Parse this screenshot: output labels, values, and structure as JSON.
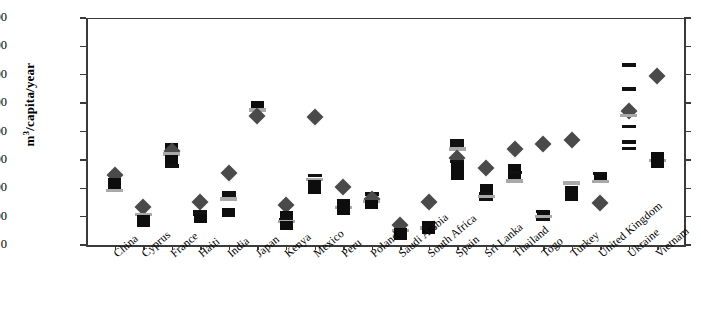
{
  "chart_data": {
    "type": "scatter",
    "title": "",
    "xlabel": "",
    "ylabel": "m3/capita/year",
    "ylabel_display": "m/capita/year",
    "ylabel_sup": "3",
    "ylim": [
      0,
      8000
    ],
    "ytick_values": [
      0,
      1000,
      2000,
      3000,
      4000,
      5000,
      6000,
      7000,
      8000
    ],
    "ytick_labels": [
      "0",
      "1000",
      "2000",
      "3000",
      "4000",
      "5000",
      "6000",
      "7000",
      "8000"
    ],
    "grid": false,
    "legend": "none",
    "categories": [
      "China",
      "Cyprus",
      "France",
      "Haiti",
      "India",
      "Japan",
      "Kenya",
      "Mexico",
      "Peru",
      "Poland",
      "Saudi Arabia",
      "South Africa",
      "Spain",
      "Sri Lanka",
      "Thailand",
      "Togo",
      "Turkey",
      "United Kingdom",
      "Ukraine",
      "Vietnam"
    ],
    "marker_kinds": {
      "sq": "black-square",
      "ln": "black-dash",
      "gln": "gray-dash",
      "dia": "gray-diamond"
    },
    "colors": {
      "square": "#0d0d0d",
      "dash": "#111111",
      "gray_dash": "#a9a9a9",
      "diamond": "#4a4a4a",
      "axis": "#3a3a3a",
      "background": "#ffffff"
    },
    "points": [
      {
        "category": "China",
        "values": [
          {
            "k": "dia",
            "v": 2450
          },
          {
            "k": "sq",
            "v": 2200
          },
          {
            "k": "sq",
            "v": 2050
          },
          {
            "k": "gln",
            "v": 1930
          }
        ]
      },
      {
        "category": "Cyprus",
        "values": [
          {
            "k": "dia",
            "v": 1350
          },
          {
            "k": "gln",
            "v": 1080
          },
          {
            "k": "sq",
            "v": 900
          },
          {
            "k": "sq",
            "v": 780
          }
        ]
      },
      {
        "category": "France",
        "values": [
          {
            "k": "sq",
            "v": 3420
          },
          {
            "k": "dia",
            "v": 3300
          },
          {
            "k": "gln",
            "v": 3210
          },
          {
            "k": "sq",
            "v": 3000
          },
          {
            "k": "ln",
            "v": 2790
          }
        ]
      },
      {
        "category": "Haiti",
        "values": [
          {
            "k": "dia",
            "v": 1530
          },
          {
            "k": "ln",
            "v": 1180
          },
          {
            "k": "ln",
            "v": 1080
          },
          {
            "k": "sq",
            "v": 930
          }
        ]
      },
      {
        "category": "India",
        "values": [
          {
            "k": "dia",
            "v": 2550
          },
          {
            "k": "ln",
            "v": 1850
          },
          {
            "k": "ln",
            "v": 1740
          },
          {
            "k": "gln",
            "v": 1620
          },
          {
            "k": "sq",
            "v": 1160
          }
        ]
      },
      {
        "category": "Japan",
        "values": [
          {
            "k": "sq",
            "v": 4930
          },
          {
            "k": "gln",
            "v": 4760
          },
          {
            "k": "dia",
            "v": 4560
          }
        ]
      },
      {
        "category": "Kenya",
        "values": [
          {
            "k": "dia",
            "v": 1400
          },
          {
            "k": "sq",
            "v": 1050
          },
          {
            "k": "ln",
            "v": 900
          },
          {
            "k": "gln",
            "v": 820
          },
          {
            "k": "sq",
            "v": 700
          }
        ]
      },
      {
        "category": "Mexico",
        "values": [
          {
            "k": "dia",
            "v": 4500
          },
          {
            "k": "ln",
            "v": 2450
          },
          {
            "k": "gln",
            "v": 2300
          },
          {
            "k": "sq",
            "v": 2130
          },
          {
            "k": "sq",
            "v": 1960
          }
        ]
      },
      {
        "category": "Peru",
        "values": [
          {
            "k": "dia",
            "v": 2030
          },
          {
            "k": "sq",
            "v": 1450
          },
          {
            "k": "gln",
            "v": 1330
          },
          {
            "k": "sq",
            "v": 1200
          }
        ]
      },
      {
        "category": "Poland",
        "values": [
          {
            "k": "ln",
            "v": 1800
          },
          {
            "k": "dia",
            "v": 1620
          },
          {
            "k": "gln",
            "v": 1530
          },
          {
            "k": "sq",
            "v": 1420
          }
        ]
      },
      {
        "category": "Saudi Arabia",
        "values": [
          {
            "k": "dia",
            "v": 700
          },
          {
            "k": "gln",
            "v": 520
          },
          {
            "k": "sq",
            "v": 430
          },
          {
            "k": "sq",
            "v": 330
          }
        ]
      },
      {
        "category": "South Africa",
        "values": [
          {
            "k": "dia",
            "v": 1500
          },
          {
            "k": "sq",
            "v": 690
          },
          {
            "k": "gln",
            "v": 600
          },
          {
            "k": "sq",
            "v": 540
          }
        ]
      },
      {
        "category": "Spain",
        "values": [
          {
            "k": "ln",
            "v": 3660
          },
          {
            "k": "ln",
            "v": 3520
          },
          {
            "k": "gln",
            "v": 3380
          },
          {
            "k": "dia",
            "v": 3060
          },
          {
            "k": "ln",
            "v": 2940
          },
          {
            "k": "sq",
            "v": 2780
          },
          {
            "k": "sq",
            "v": 2460
          }
        ]
      },
      {
        "category": "Sri Lanka",
        "values": [
          {
            "k": "dia",
            "v": 2720
          },
          {
            "k": "sq",
            "v": 2000
          },
          {
            "k": "ln",
            "v": 1820
          },
          {
            "k": "gln",
            "v": 1700
          },
          {
            "k": "ln",
            "v": 1600
          }
        ]
      },
      {
        "category": "Thailand",
        "values": [
          {
            "k": "dia",
            "v": 3400
          },
          {
            "k": "sq",
            "v": 2700
          },
          {
            "k": "ln",
            "v": 2560
          },
          {
            "k": "sq",
            "v": 2330
          },
          {
            "k": "gln",
            "v": 2260
          }
        ]
      },
      {
        "category": "Togo",
        "values": [
          {
            "k": "dia",
            "v": 3560
          },
          {
            "k": "ln",
            "v": 1180
          },
          {
            "k": "sq",
            "v": 1080
          },
          {
            "k": "gln",
            "v": 1010
          },
          {
            "k": "ln",
            "v": 900
          }
        ]
      },
      {
        "category": "Turkey",
        "values": [
          {
            "k": "dia",
            "v": 3700
          },
          {
            "k": "gln",
            "v": 2180
          },
          {
            "k": "sq",
            "v": 1930
          },
          {
            "k": "sq",
            "v": 1700
          }
        ]
      },
      {
        "category": "United Kingdom",
        "values": [
          {
            "k": "ln",
            "v": 2520
          },
          {
            "k": "sq",
            "v": 2340
          },
          {
            "k": "gln",
            "v": 2230
          },
          {
            "k": "dia",
            "v": 1470
          }
        ]
      },
      {
        "category": "Ukraine",
        "values": [
          {
            "k": "ln",
            "v": 6350
          },
          {
            "k": "ln",
            "v": 5500
          },
          {
            "k": "dia",
            "v": 4720
          },
          {
            "k": "gln",
            "v": 4560
          },
          {
            "k": "ln",
            "v": 4180
          },
          {
            "k": "ln",
            "v": 3640
          },
          {
            "k": "ln",
            "v": 3400
          }
        ]
      },
      {
        "category": "Vietnam",
        "values": [
          {
            "k": "dia",
            "v": 5950
          },
          {
            "k": "sq",
            "v": 3130
          },
          {
            "k": "gln",
            "v": 2970
          },
          {
            "k": "sq",
            "v": 2880
          }
        ]
      }
    ]
  }
}
